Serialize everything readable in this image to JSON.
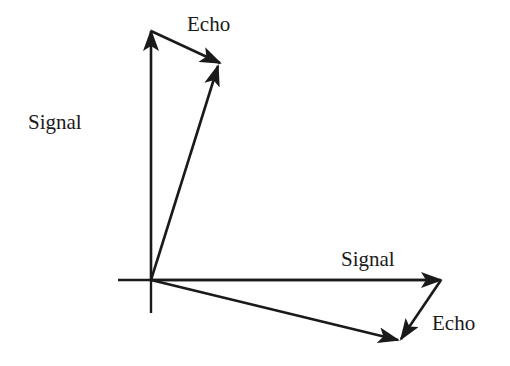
{
  "diagram": {
    "type": "phasor_vector_diagram",
    "colors": {
      "stroke": "#1a1a1a",
      "background": "#ffffff"
    },
    "axes": {
      "origin": [
        151,
        280
      ],
      "horizontal": {
        "from": [
          118,
          280
        ],
        "to": [
          441,
          280
        ]
      },
      "vertical": {
        "from": [
          151,
          313
        ],
        "to": [
          151,
          30
        ]
      }
    },
    "labels": {
      "top_echo": "Echo",
      "left_signal": "Signal",
      "right_signal": "Signal",
      "bottom_echo": "Echo"
    },
    "vectors": [
      {
        "name": "signal-vertical",
        "label": "Signal",
        "from": [
          151,
          280
        ],
        "to": [
          151,
          30
        ]
      },
      {
        "name": "echo-top",
        "label": "Echo",
        "from": [
          151,
          30
        ],
        "to": [
          220,
          63
        ]
      },
      {
        "name": "resultant-top",
        "label": "",
        "from": [
          151,
          280
        ],
        "to": [
          218,
          64
        ]
      },
      {
        "name": "signal-horizontal",
        "label": "Signal",
        "from": [
          151,
          280
        ],
        "to": [
          441,
          280
        ]
      },
      {
        "name": "echo-bottom",
        "label": "Echo",
        "from": [
          441,
          280
        ],
        "to": [
          400,
          340
        ]
      },
      {
        "name": "resultant-bottom",
        "label": "",
        "from": [
          151,
          280
        ],
        "to": [
          398,
          340
        ]
      }
    ]
  }
}
